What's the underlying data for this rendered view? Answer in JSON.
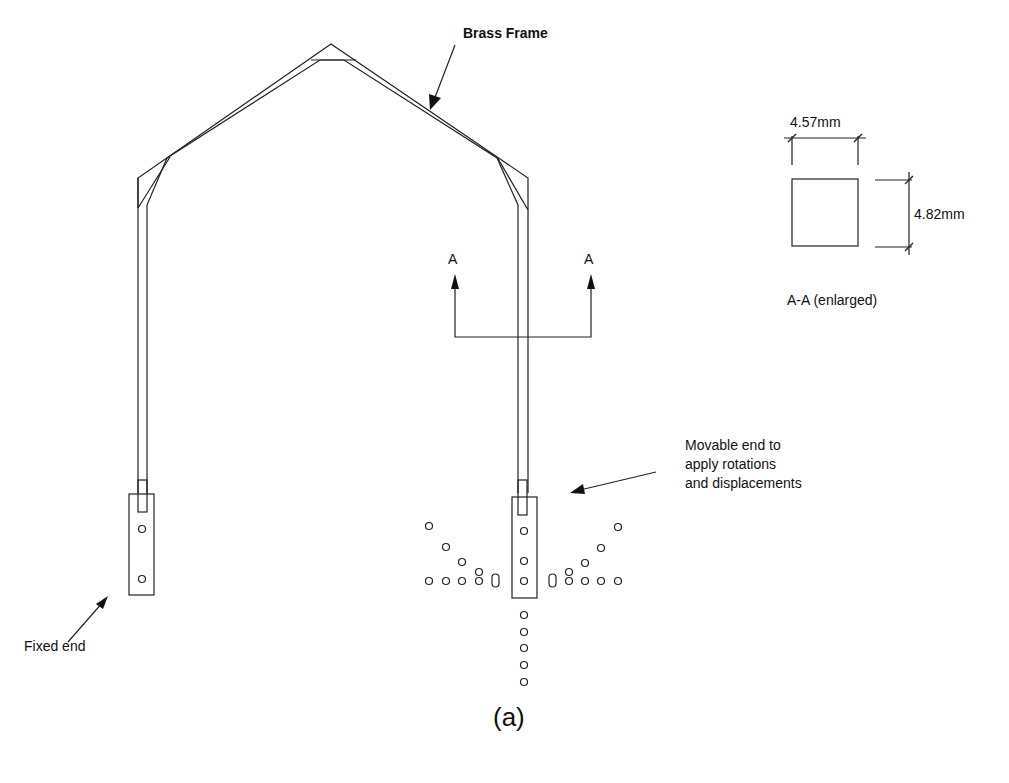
{
  "diagram": {
    "caption": "(a)",
    "labels": {
      "brass_frame": "Brass Frame",
      "fixed_end": "Fixed end",
      "movable_end_line1": "Movable end to",
      "movable_end_line2": "apply rotations",
      "movable_end_line3": "and displacements",
      "section_left": "A",
      "section_right": "A",
      "section_view_title": "A-A  (enlarged)"
    },
    "section_dimensions": {
      "width": "4.57mm",
      "height": "4.82mm"
    },
    "components": [
      "brass frame",
      "fixed end clamp",
      "movable end clamp",
      "hole pattern",
      "section A-A"
    ]
  }
}
